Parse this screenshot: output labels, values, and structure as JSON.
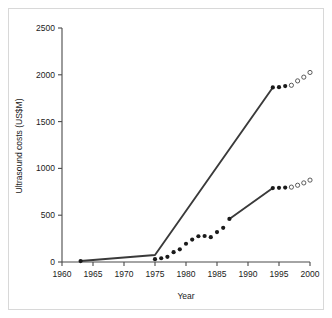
{
  "chart_data": {
    "type": "line",
    "title": "",
    "xlabel": "Year",
    "ylabel": "Ultrasound costs (US$M)",
    "xlim": [
      1960,
      2000
    ],
    "ylim": [
      0,
      2500
    ],
    "xticks": [
      1960,
      1965,
      1970,
      1975,
      1980,
      1985,
      1990,
      1995,
      2000
    ],
    "xticklabels": [
      "1960",
      "1965",
      "1970",
      "1975",
      "1980",
      "1985",
      "1990",
      "1995",
      "2000"
    ],
    "yticks": [
      0,
      500,
      1000,
      1500,
      2000,
      2500
    ],
    "yticklabels": [
      "0",
      "500",
      "1000",
      "1500",
      "2000",
      "2500"
    ],
    "grid": false,
    "legend": "none",
    "series": [
      {
        "name": "upper-series-trend-line",
        "kind": "line",
        "points": [
          {
            "x": 1963,
            "y": 10
          },
          {
            "x": 1975,
            "y": 75
          },
          {
            "x": 1994,
            "y": 1865
          }
        ]
      },
      {
        "name": "upper-series-observed",
        "kind": "marker",
        "marker": "filled",
        "points": [
          {
            "x": 1963,
            "y": 10
          },
          {
            "x": 1994,
            "y": 1865
          },
          {
            "x": 1995,
            "y": 1868
          },
          {
            "x": 1996,
            "y": 1880
          }
        ]
      },
      {
        "name": "upper-series-projected",
        "kind": "marker",
        "marker": "open",
        "points": [
          {
            "x": 1997,
            "y": 1888
          },
          {
            "x": 1998,
            "y": 1935
          },
          {
            "x": 1999,
            "y": 1975
          },
          {
            "x": 2000,
            "y": 2025
          }
        ]
      },
      {
        "name": "lower-series-trend-line",
        "kind": "line",
        "points": [
          {
            "x": 1987,
            "y": 460
          },
          {
            "x": 1994,
            "y": 790
          }
        ]
      },
      {
        "name": "lower-series-observed",
        "kind": "marker",
        "marker": "filled",
        "points": [
          {
            "x": 1975,
            "y": 30
          },
          {
            "x": 1976,
            "y": 40
          },
          {
            "x": 1977,
            "y": 55
          },
          {
            "x": 1978,
            "y": 105
          },
          {
            "x": 1979,
            "y": 135
          },
          {
            "x": 1980,
            "y": 195
          },
          {
            "x": 1981,
            "y": 240
          },
          {
            "x": 1982,
            "y": 275
          },
          {
            "x": 1983,
            "y": 278
          },
          {
            "x": 1984,
            "y": 265
          },
          {
            "x": 1985,
            "y": 320
          },
          {
            "x": 1986,
            "y": 365
          },
          {
            "x": 1987,
            "y": 460
          },
          {
            "x": 1994,
            "y": 790
          },
          {
            "x": 1995,
            "y": 793
          },
          {
            "x": 1996,
            "y": 795
          }
        ]
      },
      {
        "name": "lower-series-projected",
        "kind": "marker",
        "marker": "open",
        "points": [
          {
            "x": 1997,
            "y": 800
          },
          {
            "x": 1998,
            "y": 820
          },
          {
            "x": 1999,
            "y": 845
          },
          {
            "x": 2000,
            "y": 875
          }
        ]
      }
    ],
    "colors": {
      "line": "#3a3a3a",
      "axis": "#4a4a4a",
      "text": "#1a1a1a",
      "marker_filled": "#1a1a1a",
      "marker_open_stroke": "#4a4a4a",
      "background": "#ffffff",
      "frame": "#d8d8d8"
    }
  }
}
